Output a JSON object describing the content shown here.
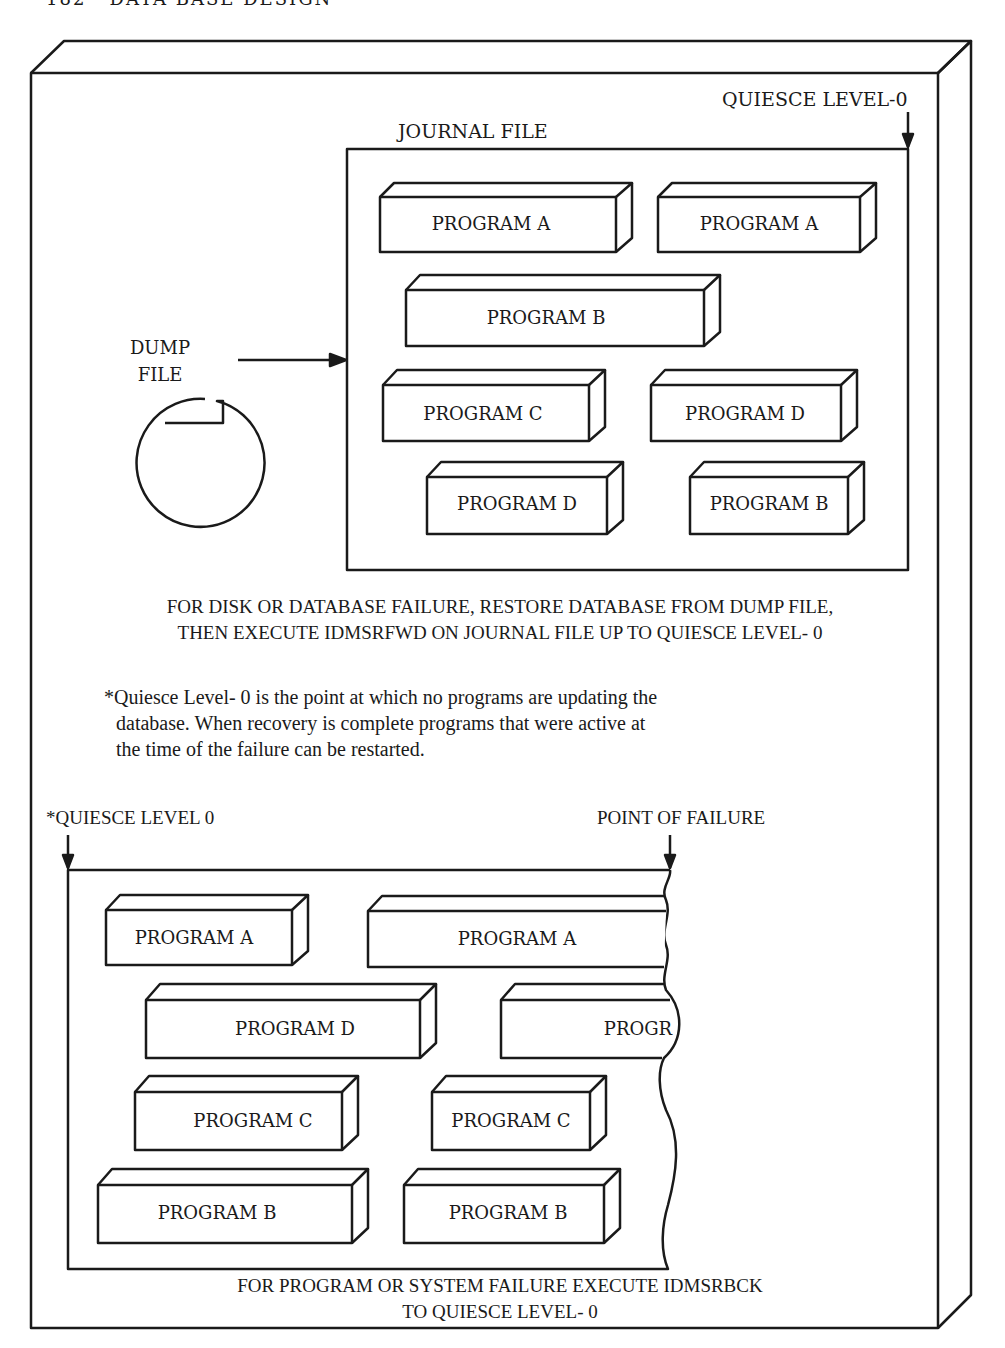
{
  "header": {
    "page_number": "182",
    "running_title": "DATA BASE DESIGN"
  },
  "top_panel": {
    "quiesce_label": "QUIESCE LEVEL-0",
    "journal_label": "JOURNAL FILE",
    "dump_file_label_line1": "DUMP",
    "dump_file_label_line2": "FILE",
    "journal_programs": [
      {
        "label": "PROGRAM A"
      },
      {
        "label": "PROGRAM A"
      },
      {
        "label": "PROGRAM B"
      },
      {
        "label": "PROGRAM C"
      },
      {
        "label": "PROGRAM D"
      },
      {
        "label": "PROGRAM D"
      },
      {
        "label": "PROGRAM B"
      }
    ],
    "caption_line1": "FOR DISK OR DATABASE FAILURE, RESTORE DATABASE FROM DUMP FILE,",
    "caption_line2": "THEN EXECUTE IDMSRFWD ON JOURNAL FILE UP TO QUIESCE LEVEL- 0"
  },
  "footnote": {
    "line1": "*Quiesce Level- 0 is the point at which no programs are updating the",
    "line2": "database. When recovery is complete programs that were active at",
    "line3": "the time of the failure can be restarted."
  },
  "bottom_panel": {
    "quiesce_label": "*QUIESCE LEVEL 0",
    "failure_label": "POINT OF FAILURE",
    "programs": [
      {
        "label": "PROGRAM A"
      },
      {
        "label": "PROGRAM A"
      },
      {
        "label": "PROGRAM D"
      },
      {
        "label": "PROGR"
      },
      {
        "label": "PROGRAM C"
      },
      {
        "label": "PROGRAM C"
      },
      {
        "label": "PROGRAM B"
      },
      {
        "label": "PROGRAM B"
      }
    ],
    "caption_line1": "FOR PROGRAM OR SYSTEM FAILURE EXECUTE IDMSRBCK",
    "caption_line2": "TO QUIESCE LEVEL- 0"
  }
}
